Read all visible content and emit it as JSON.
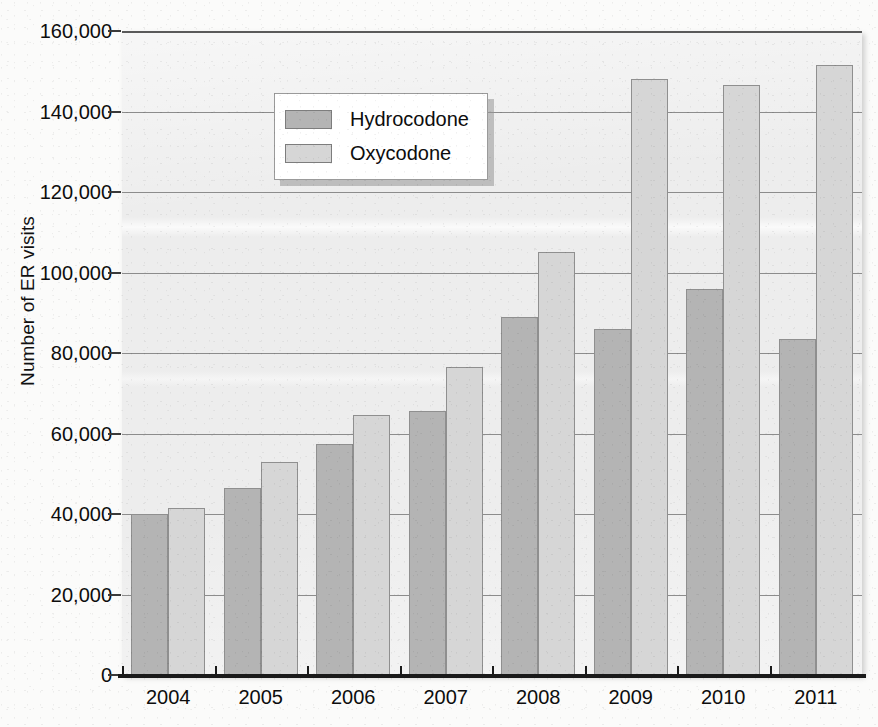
{
  "chart_data": {
    "type": "bar",
    "title": "",
    "subtitle": "",
    "xlabel": "",
    "ylabel": "Number of ER visits",
    "categories": [
      "2004",
      "2005",
      "2006",
      "2007",
      "2008",
      "2009",
      "2010",
      "2011"
    ],
    "series": [
      {
        "name": "Hydrocodone",
        "color": "#b4b4b4",
        "values": [
          40000,
          46500,
          57500,
          65500,
          89000,
          86000,
          96000,
          83500
        ]
      },
      {
        "name": "Oxycodone",
        "color": "#d6d6d6",
        "values": [
          41500,
          53000,
          64500,
          76500,
          105000,
          148000,
          146500,
          151500
        ]
      }
    ],
    "ylim": [
      0,
      160000
    ],
    "ytick_values": [
      0,
      20000,
      40000,
      60000,
      80000,
      100000,
      120000,
      140000,
      160000
    ],
    "ytick_labels": [
      "0",
      "20,000",
      "40,000",
      "60,000",
      "80,000",
      "100,000",
      "120,000",
      "140,000",
      "160,000"
    ],
    "grid": "horizontal",
    "legend_position": "upper-left-inside",
    "legend_entries": [
      "Hydrocodone",
      "Oxycodone"
    ],
    "annotations": []
  },
  "axes": {
    "y_title": "Number of ER visits"
  },
  "legend": {
    "items": [
      {
        "label": "Hydrocodone"
      },
      {
        "label": "Oxycodone"
      }
    ]
  },
  "colors": {
    "series_hydrocodone": "#b4b4b4",
    "series_oxycodone": "#d6d6d6",
    "plot_background": "#ececec",
    "gridline": "#8c8c8c",
    "axis": "#1a1a1a",
    "text": "#0d0d0d",
    "legend_background": "#ffffff"
  }
}
